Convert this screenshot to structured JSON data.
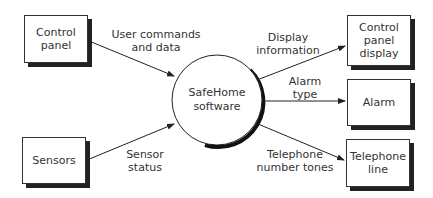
{
  "diagram": {
    "type": "context-level data flow diagram",
    "center_process": {
      "label": "SafeHome\nsoftware"
    },
    "external_entities": [
      {
        "id": "control_panel",
        "label": "Control\npanel"
      },
      {
        "id": "sensors",
        "label": "Sensors"
      },
      {
        "id": "control_panel_display",
        "label": "Control\npanel\ndisplay"
      },
      {
        "id": "alarm",
        "label": "Alarm"
      },
      {
        "id": "telephone_line",
        "label": "Telephone\nline"
      }
    ],
    "flows": [
      {
        "from": "control_panel",
        "to": "safehome",
        "label": "User commands\nand data"
      },
      {
        "from": "sensors",
        "to": "safehome",
        "label": "Sensor\nstatus"
      },
      {
        "from": "safehome",
        "to": "control_panel_display",
        "label": "Display\ninformation"
      },
      {
        "from": "safehome",
        "to": "alarm",
        "label": "Alarm\ntype"
      },
      {
        "from": "safehome",
        "to": "telephone_line",
        "label": "Telephone\nnumber tones"
      }
    ]
  }
}
